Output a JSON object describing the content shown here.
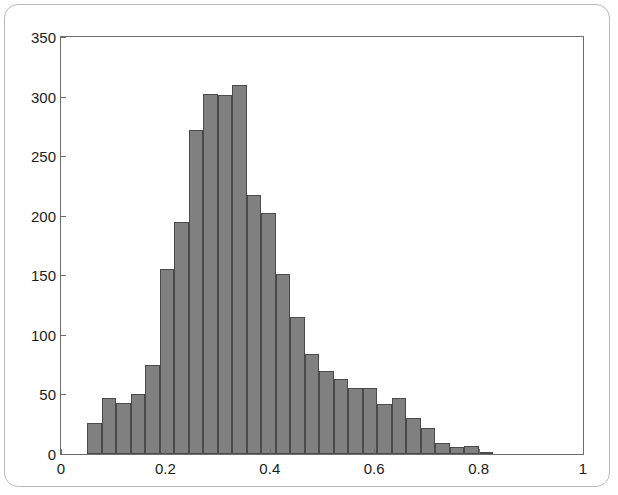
{
  "figure": {
    "background_color": "#ffffff",
    "frame_color": "#b9b9b9",
    "axis_color": "#6d6d6d"
  },
  "chart_data": {
    "type": "bar",
    "title": "",
    "subtitle": "",
    "xlabel": "",
    "ylabel": "",
    "grid": false,
    "legend": null,
    "bar_fill_color": "#808080",
    "bar_edge_color": "#4a4a4a",
    "xlim": [
      0,
      1
    ],
    "ylim": [
      0,
      350
    ],
    "xtick_labels": [
      "0",
      "0.2",
      "0.4",
      "0.6",
      "0.8",
      "1"
    ],
    "xtick_values": [
      0,
      0.2,
      0.4,
      0.6,
      0.8,
      1
    ],
    "ytick_labels": [
      "0",
      "50",
      "100",
      "150",
      "200",
      "250",
      "300",
      "350"
    ],
    "ytick_values": [
      0,
      50,
      100,
      150,
      200,
      250,
      300,
      350
    ],
    "bin_width": 0.0278,
    "bin_edges": [
      0.05,
      0.0778,
      0.1056,
      0.1333,
      0.1611,
      0.1889,
      0.2167,
      0.2444,
      0.2722,
      0.3,
      0.3278,
      0.3556,
      0.3833,
      0.4111,
      0.4389,
      0.4667,
      0.4944,
      0.5222,
      0.55,
      0.5778,
      0.6056,
      0.6333,
      0.6611,
      0.6889,
      0.7167,
      0.7444,
      0.7722,
      0.8,
      0.8278
    ],
    "bin_centers": [
      0.0639,
      0.0917,
      0.1194,
      0.1472,
      0.175,
      0.2028,
      0.2306,
      0.2583,
      0.2861,
      0.3139,
      0.3417,
      0.3694,
      0.3972,
      0.425,
      0.4528,
      0.4806,
      0.5083,
      0.5361,
      0.5639,
      0.5917,
      0.6194,
      0.6472,
      0.675,
      0.7028,
      0.7306,
      0.7583,
      0.7861,
      0.8139
    ],
    "categories": [
      "0.064",
      "0.092",
      "0.119",
      "0.147",
      "0.175",
      "0.203",
      "0.231",
      "0.258",
      "0.286",
      "0.314",
      "0.342",
      "0.369",
      "0.397",
      "0.425",
      "0.453",
      "0.481",
      "0.508",
      "0.536",
      "0.564",
      "0.592",
      "0.619",
      "0.647",
      "0.675",
      "0.703",
      "0.731",
      "0.758",
      "0.786",
      "0.814"
    ],
    "values": [
      26,
      47,
      43,
      50,
      75,
      155,
      195,
      272,
      302,
      301,
      310,
      217,
      202,
      151,
      115,
      84,
      70,
      63,
      55,
      55,
      42,
      47,
      30,
      22,
      9,
      6,
      7,
      2
    ]
  }
}
